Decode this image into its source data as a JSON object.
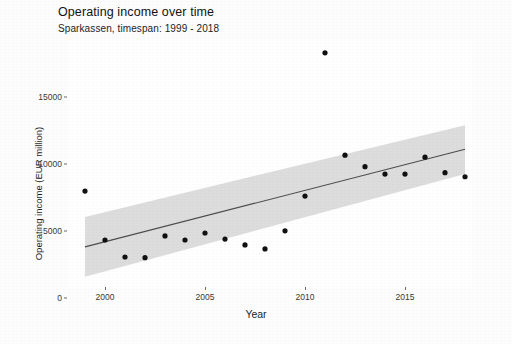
{
  "chart_data": {
    "type": "scatter",
    "title": "Operating income over time",
    "subtitle": "Sparkassen, timespan: 1999 - 2018",
    "xlabel": "Year",
    "ylabel": "Operating income (EUR million)",
    "xlim": [
      1998.4,
      2018.9
    ],
    "ylim": [
      0,
      19000
    ],
    "xticks": [
      2000,
      2005,
      2010,
      2015
    ],
    "xtick_labels": [
      "2000",
      "2005",
      "2010",
      "2015"
    ],
    "yticks": [
      0,
      5000,
      10000,
      15000
    ],
    "ytick_labels": [
      "0",
      "5000",
      "10000",
      "15000"
    ],
    "grid": false,
    "legend": "none",
    "series": [
      {
        "name": "Operating income",
        "type": "scatter",
        "marker": "filled-circle",
        "color": "#111111",
        "x": [
          1999,
          2000,
          2001,
          2002,
          2003,
          2004,
          2005,
          2006,
          2007,
          2008,
          2009,
          2010,
          2011,
          2012,
          2013,
          2014,
          2015,
          2016,
          2017,
          2018
        ],
        "y": [
          7980,
          4330,
          3060,
          3010,
          4630,
          4330,
          4850,
          4400,
          3960,
          3660,
          5010,
          7610,
          18300,
          10660,
          9800,
          9250,
          9250,
          10510,
          9350,
          9050
        ]
      },
      {
        "name": "Linear trend",
        "type": "line",
        "color": "#4d4d4d",
        "x": [
          1999,
          2018
        ],
        "y": [
          3810,
          11100
        ]
      },
      {
        "name": "Confidence band",
        "type": "ribbon",
        "color": "#c8c8c8",
        "x": [
          1999,
          2018
        ],
        "ymin": [
          1580,
          9250
        ],
        "ymax": [
          6050,
          12900
        ]
      }
    ]
  },
  "axes": {
    "ytick_positions_px": [
      298,
      231,
      163,
      97
    ],
    "xtick_positions_px": [
      105,
      205,
      305,
      405
    ]
  }
}
